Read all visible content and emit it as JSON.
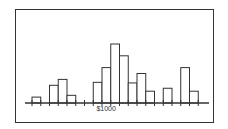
{
  "chart_data": {
    "type": "bar",
    "title": "",
    "xlabel": "",
    "ylabel": "",
    "x_tick_label": "$1000",
    "x_tick_label_index": 8,
    "grid": false,
    "bins": 19,
    "values": [
      1,
      0,
      3,
      4,
      1.3,
      0,
      0,
      3.5,
      6,
      10,
      8,
      3.4,
      5,
      2,
      0,
      2.5,
      0,
      6,
      2
    ]
  },
  "chart": {
    "axis_y": 103,
    "x_start": 32,
    "bin_width": 8.75,
    "unit_px": 5.9,
    "bar_color": "#ffffff",
    "stroke_color": "#333333"
  }
}
